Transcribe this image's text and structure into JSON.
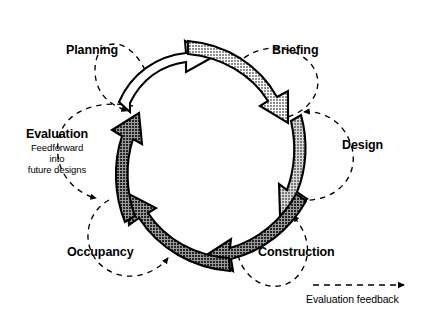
{
  "diagram": {
    "type": "cycle-diagram",
    "colors": {
      "stroke": "#000000",
      "background": "#ffffff",
      "segment_white": "#ffffff",
      "segment_light_gray": "#b3b3b3",
      "segment_mid_gray": "#9a9a9a",
      "segment_dark_gray": "#5a5a5a"
    },
    "stages": [
      {
        "id": "planning",
        "label": "Planning",
        "fill": "white",
        "direction": "clockwise",
        "position": "top-left"
      },
      {
        "id": "briefing",
        "label": "Briefing",
        "fill": "light-gray",
        "direction": "clockwise",
        "position": "top-right"
      },
      {
        "id": "design",
        "label": "Design",
        "fill": "light-gray",
        "direction": "clockwise",
        "position": "right"
      },
      {
        "id": "construction",
        "label": "Construction",
        "fill": "dark-gray",
        "direction": "clockwise",
        "position": "bottom-right"
      },
      {
        "id": "occupancy",
        "label": "Occupancy",
        "fill": "dark-gray",
        "direction": "clockwise",
        "position": "bottom-left"
      },
      {
        "id": "evaluation",
        "label": "Evaluation",
        "sublabel": "Feedforward\ninto\nfuture designs",
        "sublabel_lines": [
          "Feedforward",
          "into",
          "future designs"
        ],
        "fill": "dark-gray",
        "direction": "clockwise",
        "position": "left"
      }
    ],
    "feedback_loops": [
      {
        "id": "feedback-planning",
        "stage": "planning"
      },
      {
        "id": "feedback-briefing",
        "stage": "briefing"
      },
      {
        "id": "feedback-design",
        "stage": "design"
      },
      {
        "id": "feedback-construction",
        "stage": "construction"
      },
      {
        "id": "feedback-occupancy",
        "stage": "occupancy"
      },
      {
        "id": "feedback-evaluation",
        "stage": "evaluation"
      }
    ],
    "legend": {
      "caption": "Evaluation feedback",
      "line_style": "dashed",
      "arrow": "right"
    }
  }
}
